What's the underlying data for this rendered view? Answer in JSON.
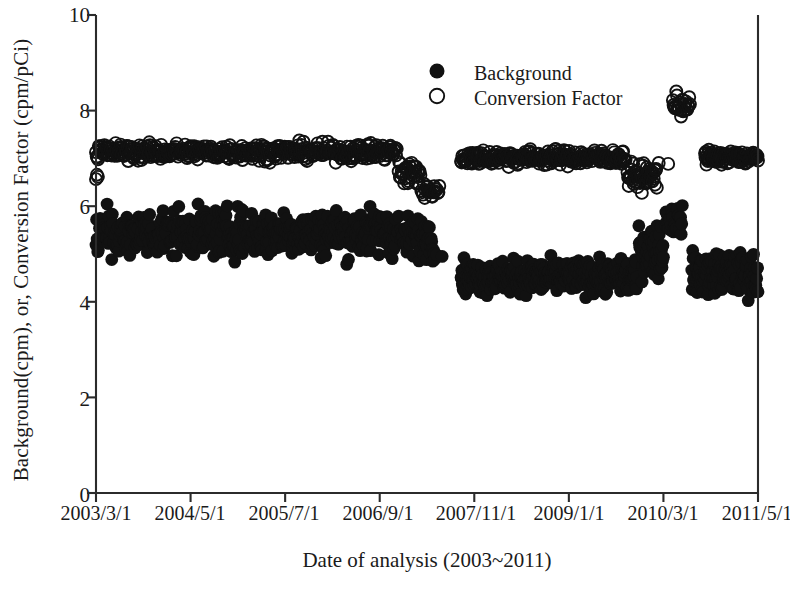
{
  "figure": {
    "background_color": "#ffffff",
    "ink_color": "#111111",
    "width": 790,
    "height": 597
  },
  "axes": {
    "x_title": "Date of analysis (2003~2011)",
    "y_title": "Background(cpm), or, Conversion Factor (cpm/pCi)",
    "y_ticks": [
      "0",
      "2",
      "4",
      "6",
      "8",
      "10"
    ],
    "x_ticks": [
      "2003/3/1",
      "2004/5/1",
      "2005/7/1",
      "2006/9/1",
      "2007/11/1",
      "2009/1/1",
      "2010/3/1",
      "2011/5/1"
    ]
  },
  "legend": {
    "position": "top-center",
    "entries": [
      {
        "label": "Background",
        "marker": "filled-circle"
      },
      {
        "label": "Conversion Factor",
        "marker": "open-circle"
      }
    ]
  },
  "chart_data": {
    "type": "scatter",
    "title": "",
    "xlabel": "Date of analysis (2003~2011)",
    "ylabel": "Background(cpm), or, Conversion Factor (cpm/pCi)",
    "ylim": [
      0,
      10
    ],
    "ytick_values": [
      0,
      2,
      4,
      6,
      8,
      10
    ],
    "xlim_index": [
      0,
      7
    ],
    "xtick_labels": [
      "2003/3/1",
      "2004/5/1",
      "2005/7/1",
      "2006/9/1",
      "2007/11/1",
      "2009/1/1",
      "2010/3/1",
      "2011/5/1"
    ],
    "grid": false,
    "legend_position": "top-center",
    "notes": [
      "Two dense scatter bands of daily QC measurements spanning 2003-2011.",
      "Conversion Factor band is the upper band of open circles near 7 cpm/pCi.",
      "Background band is the lower band of filled circles, ~5.4 early and ~4.5 after a step change in late 2008.",
      "A data gap with a short low excursion of both series occurs around 2008/4-2008/8.",
      "A transient spike in Conversion Factor to ~8.3 and in Background to ~6.0 occurs near 2010/3."
    ],
    "series": [
      {
        "name": "Conversion Factor",
        "marker": "open-circle",
        "unit": "cpm/pCi",
        "segments": [
          {
            "x_from": 0.0,
            "x_to": 0.02,
            "y_center": 6.62,
            "y_spread": 0.08,
            "n": 3,
            "label": "initial low outliers"
          },
          {
            "x_from": 0.0,
            "x_to": 3.18,
            "y_center": 7.14,
            "y_spread": 0.17,
            "n": 430,
            "label": "stable pre-2008 band"
          },
          {
            "x_from": 3.2,
            "x_to": 3.43,
            "y_center": 6.7,
            "y_spread": 0.3,
            "n": 36,
            "label": "dip before gap"
          },
          {
            "x_from": 3.44,
            "x_to": 3.63,
            "y_center": 6.32,
            "y_spread": 0.14,
            "n": 22,
            "label": "low excursion"
          },
          {
            "x_from": 3.86,
            "x_to": 5.6,
            "y_center": 7.02,
            "y_spread": 0.16,
            "n": 260,
            "label": "post-gap band, slow decline"
          },
          {
            "x_from": 5.62,
            "x_to": 5.93,
            "y_center": 6.62,
            "y_spread": 0.26,
            "n": 48,
            "label": "decline toward 2010"
          },
          {
            "x_from": 5.95,
            "x_to": 6.05,
            "y_center": 6.92,
            "y_spread": 0.05,
            "n": 2,
            "label": "isolated points"
          },
          {
            "x_from": 6.1,
            "x_to": 6.28,
            "y_center": 8.12,
            "y_spread": 0.22,
            "n": 26,
            "label": "2010 spike"
          },
          {
            "x_from": 6.44,
            "x_to": 7.0,
            "y_center": 7.02,
            "y_spread": 0.14,
            "n": 110,
            "label": "final stable band"
          }
        ],
        "approx_typical_value": 7.0,
        "approx_min": 6.2,
        "approx_max": 8.35
      },
      {
        "name": "Background",
        "marker": "filled-circle",
        "unit": "cpm",
        "segments": [
          {
            "x_from": 0.0,
            "x_to": 3.2,
            "y_center": 5.45,
            "y_spread": 0.48,
            "n": 520,
            "label": "pre-2008 band ~4.9-6.0"
          },
          {
            "x_from": 3.22,
            "x_to": 3.58,
            "y_center": 5.35,
            "y_spread": 0.42,
            "n": 60,
            "label": "pre-gap band"
          },
          {
            "x_from": 3.6,
            "x_to": 3.66,
            "y_center": 4.98,
            "y_spread": 0.04,
            "n": 2,
            "label": "isolated low points"
          },
          {
            "x_from": 3.86,
            "x_to": 5.72,
            "y_center": 4.52,
            "y_spread": 0.33,
            "n": 420,
            "label": "post-step band ~4.1-5.0"
          },
          {
            "x_from": 5.74,
            "x_to": 6.0,
            "y_center": 5.1,
            "y_spread": 0.55,
            "n": 54,
            "label": "rise toward spike"
          },
          {
            "x_from": 6.02,
            "x_to": 6.2,
            "y_center": 5.72,
            "y_spread": 0.3,
            "n": 30,
            "label": "2010 elevated"
          },
          {
            "x_from": 6.3,
            "x_to": 7.0,
            "y_center": 4.58,
            "y_spread": 0.42,
            "n": 150,
            "label": "final band ~4.1-5.1"
          }
        ],
        "approx_typical_value": 5.0,
        "approx_min": 4.05,
        "approx_max": 6.05
      }
    ]
  }
}
